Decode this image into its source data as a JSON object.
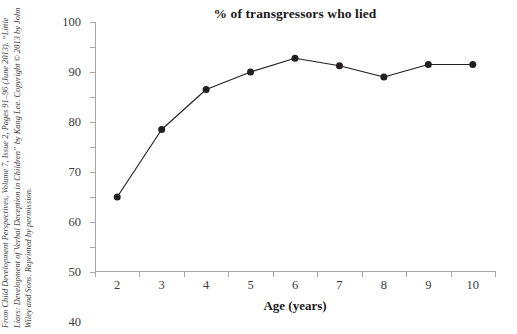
{
  "credit": {
    "text": "From Child Development Perspectives, Volume 7, Issue 2, Pages 91–96 (June 2013). “Little Liars: Development of Verbal Deception in Children” by Kang Lee. Copyright © 2013 by John Wiley and Sons. Reprinted by permission."
  },
  "bottom_caption": {
    "text": ""
  },
  "colors": {
    "line": "#231f20",
    "marker": "#231f20",
    "axis": "#a7a7a7",
    "text": "#231f20",
    "background": "#ffffff"
  },
  "chart_data": {
    "type": "line",
    "title": "% of transgressors who lied",
    "xlabel": "Age (years)",
    "ylabel": "",
    "categories": [
      "2",
      "3",
      "4",
      "5",
      "6",
      "7",
      "8",
      "9",
      "10"
    ],
    "values": [
      30,
      57,
      73,
      80,
      85.5,
      82.5,
      78,
      83,
      83
    ],
    "ylim": [
      0,
      100
    ],
    "ytick_labels": [
      "0",
      "10",
      "20",
      "30",
      "40",
      "50",
      "60",
      "70",
      "80",
      "90",
      "100"
    ],
    "ytick_values": [
      0,
      10,
      20,
      30,
      40,
      50,
      60,
      70,
      80,
      90,
      100
    ],
    "grid": false,
    "legend": false,
    "marker": "circle",
    "series": [
      {
        "name": "% of transgressors who lied",
        "values": [
          30,
          57,
          73,
          80,
          85.5,
          82.5,
          78,
          83,
          83
        ]
      }
    ]
  }
}
